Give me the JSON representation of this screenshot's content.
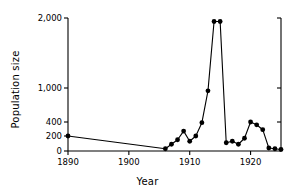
{
  "chart_data": {
    "type": "line",
    "title": "",
    "xlabel": "Year",
    "ylabel": "Population size",
    "xlim": [
      1890,
      1925
    ],
    "ylim": [
      0,
      2000
    ],
    "grid": false,
    "legend": null,
    "y_axis_note": "broken / non-linear scale: equal spacing between 0-200-400, then compressed 400-1000-2000",
    "xticks": [
      1890,
      1900,
      1910,
      1920
    ],
    "xticklabels": [
      "1890",
      "1900",
      "1910",
      "1920"
    ],
    "yticks": [
      0,
      200,
      400,
      1000,
      2000
    ],
    "yticklabels": [
      "0",
      "200",
      "400",
      "1,000",
      "2,000"
    ],
    "marker": "filled-circle",
    "line_color": "#000000",
    "marker_color": "#000000",
    "series": [
      {
        "name": "Population size",
        "x": [
          1890,
          1906,
          1907,
          1908,
          1909,
          1910,
          1911,
          1912,
          1913,
          1914,
          1915,
          1916,
          1917,
          1918,
          1919,
          1920,
          1921,
          1922,
          1923,
          1924,
          1925
        ],
        "values": [
          200,
          30,
          90,
          150,
          270,
          130,
          200,
          390,
          950,
          1950,
          1950,
          110,
          130,
          90,
          170,
          400,
          360,
          290,
          40,
          30,
          20
        ]
      }
    ]
  },
  "axis_titles": {
    "y": "Population size",
    "x": "Year"
  }
}
